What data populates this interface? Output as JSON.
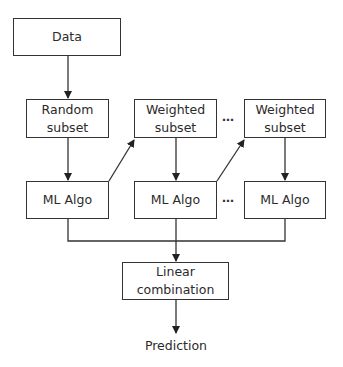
{
  "diagram": {
    "title": "",
    "nodes": {
      "data": {
        "line1": "Data"
      },
      "random_subset": {
        "line1": "Random",
        "line2": "subset"
      },
      "weighted_subset_1": {
        "line1": "Weighted",
        "line2": "subset"
      },
      "weighted_subset_n": {
        "line1": "Weighted",
        "line2": "subset"
      },
      "ml_algo_1": {
        "line1": "ML Algo"
      },
      "ml_algo_2": {
        "line1": "ML Algo"
      },
      "ml_algo_n": {
        "line1": "ML Algo"
      },
      "linear_combination": {
        "line1": "Linear",
        "line2": "combination"
      },
      "prediction": {
        "line1": "Prediction"
      }
    },
    "ellipsis": "…",
    "edges": [
      [
        "data",
        "random_subset"
      ],
      [
        "random_subset",
        "ml_algo_1"
      ],
      [
        "ml_algo_1",
        "weighted_subset_1"
      ],
      [
        "weighted_subset_1",
        "ml_algo_2"
      ],
      [
        "ml_algo_2",
        "weighted_subset_n"
      ],
      [
        "weighted_subset_n",
        "ml_algo_n"
      ],
      [
        "ml_algo_1",
        "linear_combination"
      ],
      [
        "ml_algo_2",
        "linear_combination"
      ],
      [
        "ml_algo_n",
        "linear_combination"
      ],
      [
        "linear_combination",
        "prediction"
      ]
    ],
    "colors": {
      "stroke": "#333333",
      "text": "#2b2b2b",
      "background": "#ffffff"
    }
  }
}
